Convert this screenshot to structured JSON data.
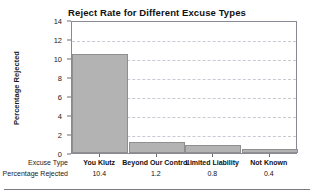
{
  "chart_data": {
    "type": "bar",
    "title": "Reject Rate for Different Excuse Types",
    "xlabel": "Excuse Type",
    "ylabel": "Percentage Rejected",
    "categories": [
      "You Klutz",
      "Beyond Our Control",
      "Limited Liability",
      "Not Known"
    ],
    "values": [
      10.4,
      1.2,
      0.8,
      0.4
    ],
    "value_strings": [
      "10.4",
      "1.2",
      "0.8",
      "0.4"
    ],
    "ylim": [
      0,
      14
    ],
    "yticks": [
      0,
      2,
      4,
      6,
      8,
      10,
      12,
      14
    ],
    "ytick_labels": [
      "0",
      "2",
      "4",
      "6",
      "8",
      "10",
      "12",
      "14"
    ],
    "grid": true,
    "grid_axis": "y",
    "legend": "none",
    "bar_color": "#b3b3b3",
    "bar_edge_color": "#8f8f8f",
    "grid_color": "#c9c9d4",
    "axis_color": "#8a8a96",
    "row_headers": [
      "Excuse Type",
      "Percentage Rejected"
    ]
  }
}
